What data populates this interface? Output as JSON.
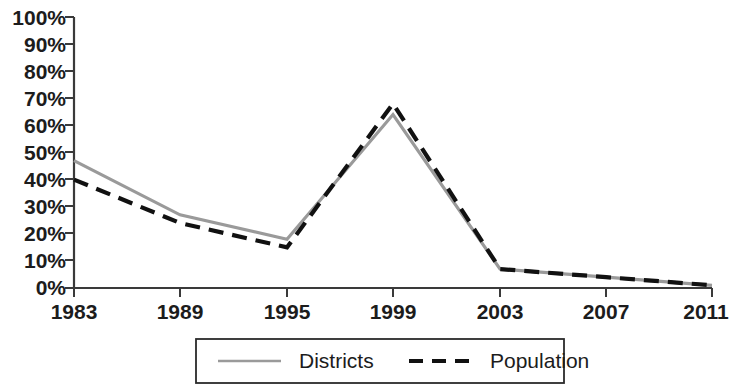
{
  "chart_data": {
    "type": "line",
    "title": "",
    "xlabel": "",
    "ylabel": "",
    "x": [
      1983,
      1989,
      1995,
      1999,
      2003,
      2007,
      2011
    ],
    "categories": [
      "1983",
      "1989",
      "1995",
      "1999",
      "2003",
      "2007",
      "2011"
    ],
    "series": [
      {
        "name": "Districts",
        "style": "solid",
        "color": "#9a9a9a",
        "values": [
          47,
          27,
          18,
          64,
          7,
          4,
          1
        ]
      },
      {
        "name": "Population",
        "style": "dashed",
        "color": "#111111",
        "values": [
          40,
          24,
          15,
          68,
          7,
          4,
          1
        ]
      }
    ],
    "ylim": [
      0,
      100
    ],
    "ytick_values": [
      0,
      10,
      20,
      30,
      40,
      50,
      60,
      70,
      80,
      90,
      100
    ],
    "ytick_labels": [
      "0%",
      "10%",
      "20%",
      "30%",
      "40%",
      "50%",
      "60%",
      "70%",
      "80%",
      "90%",
      "100%"
    ],
    "xtick_labels": [
      "1983",
      "1989",
      "1995",
      "1999",
      "2003",
      "2007",
      "2011"
    ],
    "grid": false,
    "legend_position": "bottom",
    "value_suffix": "%"
  },
  "legend": {
    "entries": [
      {
        "label": "Districts",
        "swatch": "solid-gray-line"
      },
      {
        "label": "Population",
        "swatch": "dashed-black-line"
      }
    ]
  },
  "axes": {
    "y_axis_name": "percent-axis",
    "x_axis_name": "year-axis"
  }
}
